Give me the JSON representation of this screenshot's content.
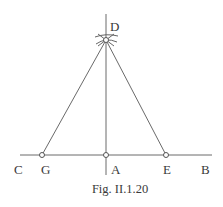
{
  "figure": {
    "caption": "Fig. II.1.20",
    "points": {
      "D": {
        "label": "D",
        "x": 106,
        "y": 40
      },
      "A": {
        "label": "A",
        "x": 106,
        "y": 155
      },
      "G": {
        "label": "G",
        "x": 42,
        "y": 155
      },
      "E": {
        "label": "E",
        "x": 166,
        "y": 155
      },
      "C": {
        "label": "C"
      },
      "B": {
        "label": "B"
      }
    },
    "lines": [
      {
        "name": "CB",
        "from": [
          20,
          155
        ],
        "to": [
          212,
          155
        ]
      },
      {
        "name": "perpendicular-at-A",
        "from": [
          106,
          14
        ],
        "to": [
          106,
          175
        ]
      },
      {
        "name": "DG",
        "from": [
          106,
          40
        ],
        "to": [
          42,
          155
        ]
      },
      {
        "name": "DE",
        "from": [
          106,
          40
        ],
        "to": [
          166,
          155
        ]
      }
    ]
  }
}
